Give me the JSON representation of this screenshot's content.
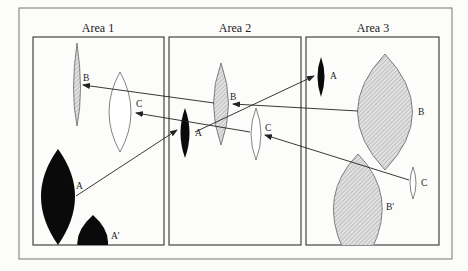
{
  "diagram": {
    "areas": [
      {
        "id": "area-1",
        "title": "Area 1"
      },
      {
        "id": "area-2",
        "title": "Area 2"
      },
      {
        "id": "area-3",
        "title": "Area 3"
      }
    ],
    "shapes": {
      "area1": {
        "B": "B",
        "C": "C",
        "A": "A",
        "A_prime": "A'"
      },
      "area2": {
        "A": "A",
        "B": "B",
        "C": "C"
      },
      "area3": {
        "A": "A",
        "B": "B",
        "C": "C",
        "B_prime": "B'"
      }
    },
    "legend_meaning": {
      "black_fill": "species A",
      "hatched_fill": "species B",
      "white_fill": "species C"
    },
    "arrows": [
      {
        "from": "Area 1 A",
        "to": "Area 2 A"
      },
      {
        "from": "Area 2 A",
        "to": "Area 3 A"
      },
      {
        "from": "Area 3 B",
        "to": "Area 2 B"
      },
      {
        "from": "Area 2 B",
        "to": "Area 1 B"
      },
      {
        "from": "Area 3 C",
        "to": "Area 2 C"
      },
      {
        "from": "Area 2 C",
        "to": "Area 1 C"
      }
    ],
    "colors": {
      "frame": "#555555",
      "black_fill": "#0a0a0a",
      "hatch": "#9a9a9a",
      "hatch_bg": "#dedede",
      "background": "#fcfcfa"
    }
  }
}
